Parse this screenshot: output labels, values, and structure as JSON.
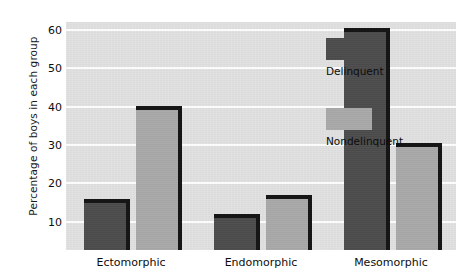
{
  "chart_data": {
    "type": "bar",
    "title": "",
    "xlabel": "",
    "ylabel": "Percentage of boys in each group",
    "categories": [
      "Ectomorphic",
      "Endomorphic",
      "Mesomorphic"
    ],
    "series": [
      {
        "name": "Delinquent",
        "color": "#4b4b4b",
        "values": [
          15,
          11,
          59.5
        ]
      },
      {
        "name": "Nondelinquent",
        "color": "#a8a8a8",
        "values": [
          39,
          16,
          29.5
        ]
      }
    ],
    "ylim": [
      2.7,
      62
    ],
    "yticks": [
      10,
      20,
      30,
      40,
      50,
      60
    ],
    "ytick_labels": [
      "10",
      "20",
      "30",
      "40",
      "50",
      "60"
    ],
    "grid": true,
    "grid_color": "#fbfbfb",
    "plot_background": "#e0e0e0",
    "legend_position": "inside-top-right"
  }
}
